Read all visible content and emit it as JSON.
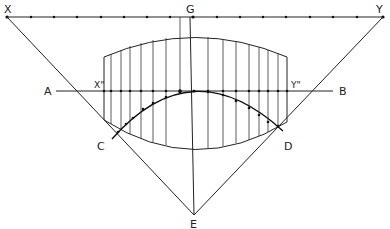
{
  "diagram": {
    "labels": {
      "X": "X",
      "Y": "Y",
      "G": "G",
      "A": "A",
      "B": "B",
      "C": "C",
      "D": "D",
      "E": "E",
      "X2": "X\"",
      "Y2": "Y\""
    },
    "points": {
      "X": [
        7,
        17
      ],
      "Y": [
        383,
        17
      ],
      "G": [
        190,
        17
      ],
      "E": [
        194,
        215
      ],
      "A_end": [
        56,
        91
      ],
      "B_end": [
        333,
        91
      ]
    },
    "colors": {
      "stroke": "#222222",
      "background": "#ffffff"
    }
  }
}
